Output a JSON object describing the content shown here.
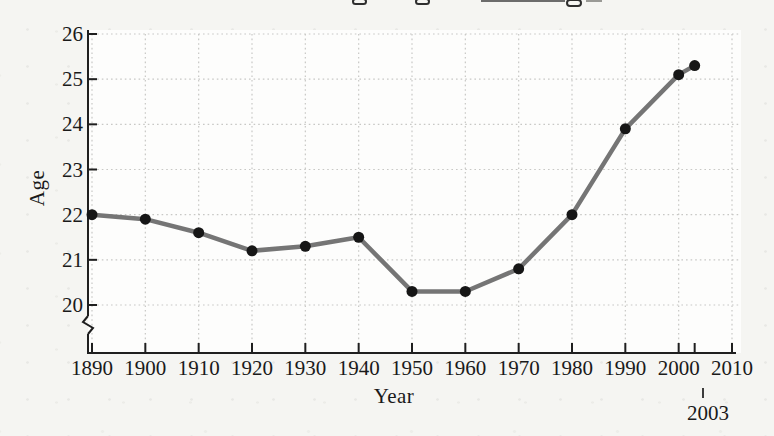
{
  "figure": {
    "y_axis_title": "Age",
    "x_axis_title": "Year",
    "annotation_2003": "2003"
  },
  "chart_data": {
    "type": "line",
    "title_cropped_out_of_frame": true,
    "x": [
      1890,
      1900,
      1910,
      1920,
      1930,
      1940,
      1950,
      1960,
      1970,
      1980,
      1990,
      2000,
      2003
    ],
    "values": [
      22.0,
      21.9,
      21.6,
      21.2,
      21.3,
      21.5,
      20.3,
      20.3,
      20.8,
      22.0,
      23.9,
      25.1,
      25.3
    ],
    "xlabel": "Year",
    "ylabel": "Age",
    "xlim": [
      1890,
      2010
    ],
    "ylim": [
      20,
      26
    ],
    "x_tick_values": [
      1890,
      1900,
      1910,
      1920,
      1930,
      1940,
      1950,
      1960,
      1970,
      1980,
      1990,
      2000,
      2010
    ],
    "x_tick_labels": [
      "1890",
      "1900",
      "1910",
      "1920",
      "1930",
      "1940",
      "1950",
      "1960",
      "1970",
      "1980",
      "1990",
      "2000",
      "2010"
    ],
    "y_tick_values": [
      20,
      21,
      22,
      23,
      24,
      25,
      26
    ],
    "y_tick_labels": [
      "20",
      "21",
      "22",
      "23",
      "24",
      "25",
      "26"
    ],
    "extra_x_tick": 2003,
    "annotation": {
      "x": 2003,
      "label": "2003"
    },
    "grid": "dotted",
    "legend": "none",
    "y_axis_break_below_min": true,
    "line_color": "#757575",
    "marker_color": "#161616",
    "axis_color": "#1f1f1f",
    "grid_color": "#c8c8c5",
    "label_color": "#1a1a1a",
    "plot_bg_color": "#fdfdfc"
  }
}
